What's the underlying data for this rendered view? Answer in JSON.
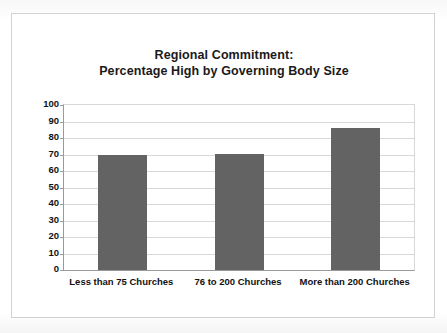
{
  "chart_data": {
    "type": "bar",
    "title": "Regional Commitment: Percentage High by Governing Body Size",
    "title_lines": [
      "Regional Commitment:",
      "Percentage High by Governing Body Size"
    ],
    "categories": [
      "Less than 75 Churches",
      "76 to 200 Churches",
      "More than 200 Churches"
    ],
    "values": [
      69.5,
      70.5,
      86
    ],
    "xlabel": "",
    "ylabel": "",
    "ylim": [
      0,
      100
    ],
    "ytick_step": 10,
    "ytick_labels": [
      "100",
      "90",
      "80",
      "70",
      "60",
      "50",
      "40",
      "30",
      "20",
      "10",
      "0"
    ],
    "grid": "horizontal",
    "legend": "none",
    "bar_color": "#636363",
    "gridline_color": "#d8d8d8",
    "axis_color": "#9a9a9a",
    "frame_color": "#d2d2d2",
    "text_color": "#111111"
  }
}
